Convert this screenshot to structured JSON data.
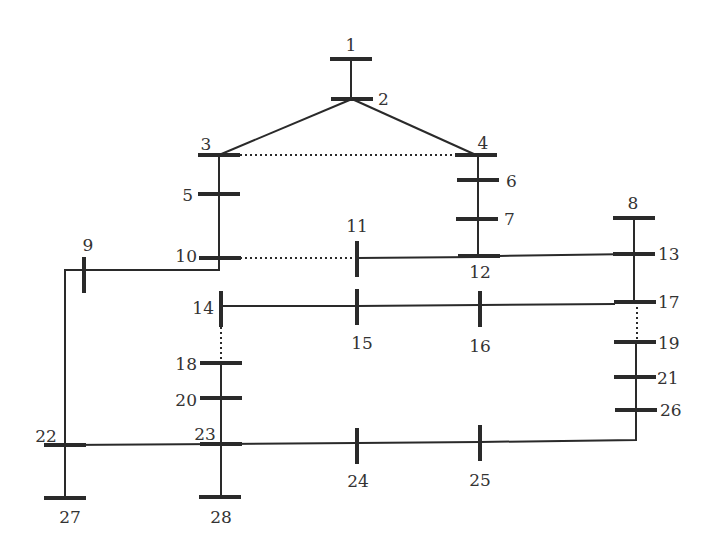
{
  "colors": {
    "line": "#2a2a2a",
    "label": "#333333",
    "background": "#ffffff"
  },
  "buses": [
    {
      "id": "1",
      "label": "1"
    },
    {
      "id": "2",
      "label": "2"
    },
    {
      "id": "3",
      "label": "3"
    },
    {
      "id": "4",
      "label": "4"
    },
    {
      "id": "5",
      "label": "5"
    },
    {
      "id": "6",
      "label": "6"
    },
    {
      "id": "7",
      "label": "7"
    },
    {
      "id": "8",
      "label": "8"
    },
    {
      "id": "9",
      "label": "9"
    },
    {
      "id": "10",
      "label": "10"
    },
    {
      "id": "11",
      "label": "11"
    },
    {
      "id": "12",
      "label": "12"
    },
    {
      "id": "13",
      "label": "13"
    },
    {
      "id": "14",
      "label": "14"
    },
    {
      "id": "15",
      "label": "15"
    },
    {
      "id": "16",
      "label": "16"
    },
    {
      "id": "17",
      "label": "17"
    },
    {
      "id": "18",
      "label": "18"
    },
    {
      "id": "19",
      "label": "19"
    },
    {
      "id": "20",
      "label": "20"
    },
    {
      "id": "21",
      "label": "21"
    },
    {
      "id": "22",
      "label": "22"
    },
    {
      "id": "23",
      "label": "23"
    },
    {
      "id": "24",
      "label": "24"
    },
    {
      "id": "25",
      "label": "25"
    },
    {
      "id": "26",
      "label": "26"
    },
    {
      "id": "27",
      "label": "27"
    },
    {
      "id": "28",
      "label": "28"
    }
  ],
  "branches": [
    {
      "from": "1",
      "to": "2",
      "style": "solid"
    },
    {
      "from": "2",
      "to": "3",
      "style": "solid"
    },
    {
      "from": "2",
      "to": "4",
      "style": "solid"
    },
    {
      "from": "3",
      "to": "4",
      "style": "dotted"
    },
    {
      "from": "3",
      "to": "5",
      "style": "solid"
    },
    {
      "from": "5",
      "to": "10",
      "style": "solid"
    },
    {
      "from": "4",
      "to": "6",
      "style": "solid"
    },
    {
      "from": "6",
      "to": "7",
      "style": "solid"
    },
    {
      "from": "7",
      "to": "12",
      "style": "solid"
    },
    {
      "from": "10",
      "to": "9",
      "style": "solid"
    },
    {
      "from": "9",
      "to": "22",
      "style": "solid"
    },
    {
      "from": "10",
      "to": "11",
      "style": "dotted"
    },
    {
      "from": "11",
      "to": "12",
      "style": "solid"
    },
    {
      "from": "12",
      "to": "13",
      "style": "solid"
    },
    {
      "from": "8",
      "to": "13",
      "style": "solid"
    },
    {
      "from": "13",
      "to": "17",
      "style": "solid"
    },
    {
      "from": "14",
      "to": "15",
      "style": "solid"
    },
    {
      "from": "15",
      "to": "16",
      "style": "solid"
    },
    {
      "from": "16",
      "to": "17",
      "style": "solid"
    },
    {
      "from": "14",
      "to": "18",
      "style": "dotted"
    },
    {
      "from": "17",
      "to": "19",
      "style": "dotted"
    },
    {
      "from": "18",
      "to": "20",
      "style": "solid"
    },
    {
      "from": "20",
      "to": "23",
      "style": "solid"
    },
    {
      "from": "19",
      "to": "21",
      "style": "solid"
    },
    {
      "from": "21",
      "to": "26",
      "style": "solid"
    },
    {
      "from": "22",
      "to": "23",
      "style": "solid"
    },
    {
      "from": "23",
      "to": "24",
      "style": "solid"
    },
    {
      "from": "24",
      "to": "25",
      "style": "solid"
    },
    {
      "from": "25",
      "to": "26",
      "style": "solid"
    },
    {
      "from": "22",
      "to": "27",
      "style": "solid"
    },
    {
      "from": "23",
      "to": "28",
      "style": "solid"
    }
  ]
}
